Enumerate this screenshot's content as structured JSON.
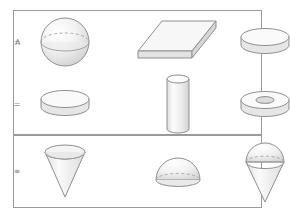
{
  "figure": {
    "background_color": "#ffffff",
    "panel_border_color": "#9a9a9a",
    "shape_outline_color": "#8f8f8f",
    "shape_fill_light": "#fbfbfb",
    "shape_fill_mid": "#eeeeee",
    "shape_fill_dark": "#dcdcdc",
    "hidden_edge_style": "dashed"
  },
  "panels": [
    {
      "id": "panel-top",
      "rows": [
        {
          "id": "row-intersect",
          "operation_name": "intersection",
          "operator": "∧",
          "equals": "=",
          "operand_a": {
            "shape": "sphere",
            "label": "sphere"
          },
          "operand_b": {
            "shape": "slab",
            "label": "rectangular slab"
          },
          "result": {
            "shape": "disc",
            "label": "flat disc"
          }
        },
        {
          "id": "row-difference",
          "operation_name": "difference",
          "operator": "–",
          "equals": "=",
          "operand_a": {
            "shape": "disc",
            "label": "flat disc"
          },
          "operand_b": {
            "shape": "cylinder",
            "label": "tall cylinder"
          },
          "result": {
            "shape": "washer",
            "label": "annular washer"
          }
        }
      ]
    },
    {
      "id": "panel-bottom",
      "rows": [
        {
          "id": "row-union",
          "operation_name": "union",
          "operator": "+",
          "equals": "=",
          "operand_a": {
            "shape": "cone",
            "label": "inverted cone"
          },
          "operand_b": {
            "shape": "hemisphere",
            "label": "hemisphere dome"
          },
          "result": {
            "shape": "cone-hemisphere",
            "label": "cone with hemisphere cap"
          }
        }
      ]
    }
  ]
}
